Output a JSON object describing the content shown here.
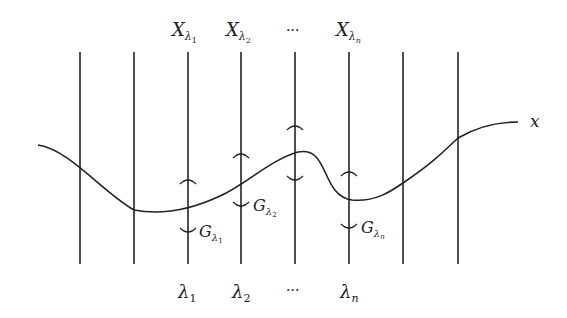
{
  "diagram": {
    "top_labels": [
      {
        "main": "X",
        "sub": "λ",
        "subsub": "1"
      },
      {
        "main": "X",
        "sub": "λ",
        "subsub": "2"
      },
      {
        "main": "···",
        "sub": "",
        "subsub": ""
      },
      {
        "main": "X",
        "sub": "λ",
        "subsub": "n"
      }
    ],
    "bottom_labels": [
      {
        "main": "λ",
        "sub": "1"
      },
      {
        "main": "λ",
        "sub": "2"
      },
      {
        "main": "···",
        "sub": ""
      },
      {
        "main": "λ",
        "sub": "n"
      }
    ],
    "group_labels": [
      {
        "main": "G",
        "sub": "λ",
        "subsub": "1"
      },
      {
        "main": "G",
        "sub": "λ",
        "subsub": "2"
      },
      {
        "main": "G",
        "sub": "λ",
        "subsub": "n"
      }
    ],
    "curve_label": "x",
    "line_color": "#222222"
  }
}
